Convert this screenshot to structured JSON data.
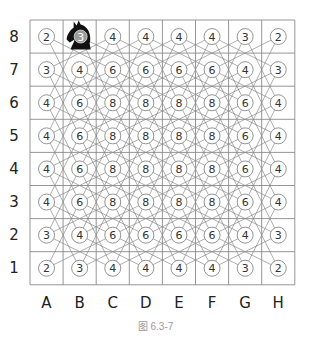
{
  "figure": {
    "caption": "图 6.3-7",
    "ranks": [
      "8",
      "7",
      "6",
      "5",
      "4",
      "3",
      "2",
      "1"
    ],
    "files": [
      "A",
      "B",
      "C",
      "D",
      "E",
      "F",
      "G",
      "H"
    ],
    "board": {
      "left": 30,
      "top": 20,
      "cell": 33.1,
      "grid_color": "#8a8a8a",
      "edge_color": "#777777",
      "circle_stroke": "#888888",
      "circle_fill": "#ffffff"
    },
    "knight_piece": {
      "file": "B",
      "rank": "8",
      "icon": "knight-icon",
      "color": "#111111"
    },
    "move_counts": [
      [
        2,
        3,
        4,
        4,
        4,
        4,
        3,
        2
      ],
      [
        3,
        4,
        6,
        6,
        6,
        6,
        4,
        3
      ],
      [
        4,
        6,
        8,
        8,
        8,
        8,
        6,
        4
      ],
      [
        4,
        6,
        8,
        8,
        8,
        8,
        6,
        4
      ],
      [
        4,
        6,
        8,
        8,
        8,
        8,
        6,
        4
      ],
      [
        4,
        6,
        8,
        8,
        8,
        8,
        6,
        4
      ],
      [
        3,
        4,
        6,
        6,
        6,
        6,
        4,
        3
      ],
      [
        2,
        3,
        4,
        4,
        4,
        4,
        3,
        2
      ]
    ]
  }
}
